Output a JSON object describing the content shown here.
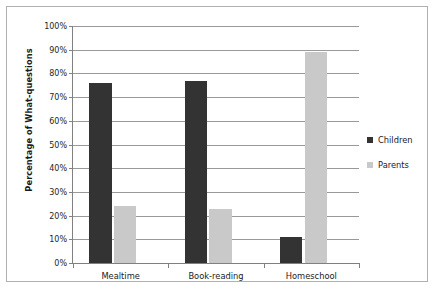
{
  "chart_data": {
    "type": "bar",
    "title": "",
    "xlabel": "",
    "ylabel": "Percentage of What-questions",
    "categories": [
      "Mealtime",
      "Book-reading",
      "Homeschool"
    ],
    "series": [
      {
        "name": "Children",
        "color": "#333333",
        "values": [
          76,
          77,
          11
        ]
      },
      {
        "name": "Parents",
        "color": "#c9c9c9",
        "values": [
          24,
          23,
          89
        ]
      }
    ],
    "ylim": [
      0,
      100
    ],
    "ytick_values": [
      0,
      10,
      20,
      30,
      40,
      50,
      60,
      70,
      80,
      90,
      100
    ],
    "ytick_labels": [
      "0%",
      "10%",
      "20%",
      "30%",
      "40%",
      "50%",
      "60%",
      "70%",
      "80%",
      "90%",
      "100%"
    ],
    "grid": true,
    "legend_position": "right",
    "axis_color": "#808080",
    "gridline_color": "#999999",
    "border_color": "#b0b0b0",
    "background_color": "#ffffff"
  }
}
